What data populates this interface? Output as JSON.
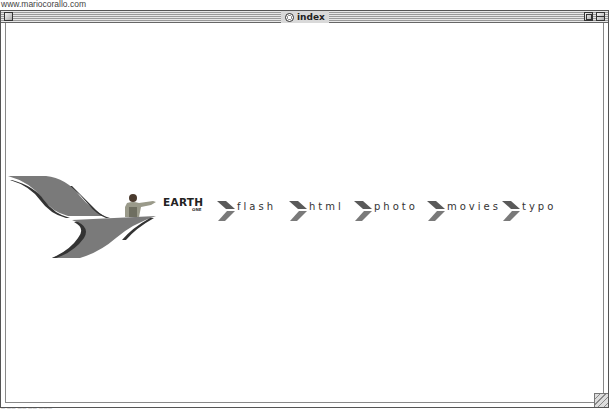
{
  "browser": {
    "url": "www.mariocorallo.com"
  },
  "window": {
    "title": "index"
  },
  "brand": {
    "name": "EARTH",
    "sub": "ONE"
  },
  "nav": {
    "items": [
      {
        "label": "flash",
        "left": 217
      },
      {
        "label": "html",
        "left": 289
      },
      {
        "label": "photo",
        "left": 354
      },
      {
        "label": "movies",
        "left": 427
      },
      {
        "label": "typo",
        "left": 502
      }
    ]
  },
  "status": {
    "text": "— —— —— —— ———"
  },
  "colors": {
    "chevron": "#6b6b6b",
    "chevron_dark": "#4a4a4a",
    "wing": "#777777",
    "wing_dark": "#3a3a3a"
  }
}
